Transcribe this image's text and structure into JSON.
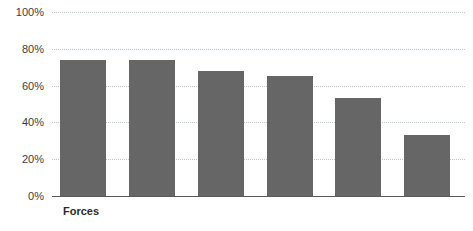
{
  "chart_data": {
    "type": "bar",
    "title": "",
    "xlabel": "",
    "ylabel": "",
    "categories": [
      "Forces",
      "",
      "",
      "",
      "",
      ""
    ],
    "values": [
      74,
      74,
      68,
      65,
      53,
      33
    ],
    "ylim": [
      0,
      100
    ],
    "yticks": [
      0,
      20,
      40,
      60,
      80,
      100
    ],
    "ytick_labels": [
      "0%",
      "20%",
      "40%",
      "60%",
      "80%",
      "100%"
    ],
    "grid": true,
    "legend": "none",
    "bar_color": "#666666",
    "gridline_color": "#b9c6d4",
    "axis_color": "#595959",
    "tick_label_color": "#3c3c3c",
    "category_label_color": "#2b2b2b"
  },
  "axis": {
    "y_labels": [
      {
        "text": "100%",
        "value": 100
      },
      {
        "text": "80%",
        "value": 80
      },
      {
        "text": "60%",
        "value": 60
      },
      {
        "text": "40%",
        "value": 40
      },
      {
        "text": "20%",
        "value": 20
      },
      {
        "text": "0%",
        "value": 0
      }
    ]
  },
  "category_labels": [
    {
      "text": "Forces",
      "bar_index": 0
    }
  ]
}
